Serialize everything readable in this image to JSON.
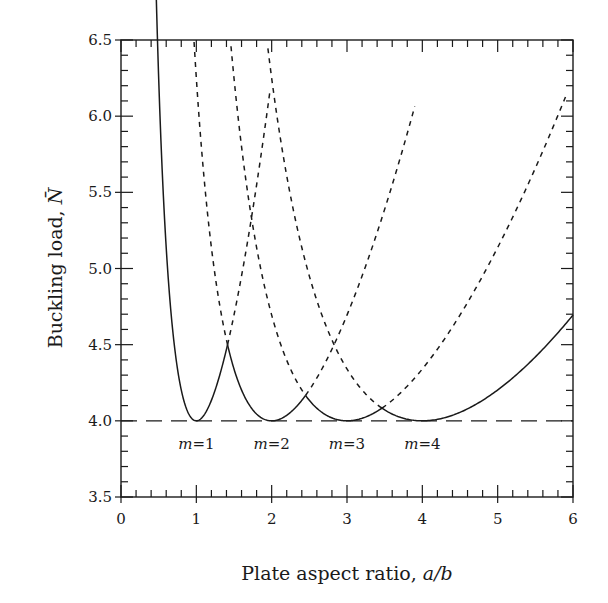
{
  "chart_data": {
    "type": "line",
    "title": "",
    "xlabel": "Plate aspect ratio, a/b",
    "xlabel_parts": {
      "text": "Plate aspect ratio, ",
      "italic": "a/b"
    },
    "ylabel": "Buckling load, N̄",
    "ylabel_parts": {
      "text": "Buckling load, ",
      "italic": "N̄"
    },
    "xlim": [
      0,
      6
    ],
    "ylim": [
      3.5,
      6.5
    ],
    "x_ticks": [
      "0",
      "1",
      "2",
      "3",
      "4",
      "5",
      "6"
    ],
    "y_ticks": [
      "3.5",
      "4.0",
      "4.5",
      "5.0",
      "5.5",
      "6.0",
      "6.5"
    ],
    "x_minor_step": 0.2,
    "y_minor_step": 0.1,
    "grid": false,
    "legend": null,
    "formula": "N = (m·b/a + a/(m·b))^2",
    "series": [
      {
        "name": "m=1",
        "m": 1,
        "label": "m=1",
        "label_x": 1.0,
        "solid_range": [
          0.45,
          1.414
        ],
        "dashed_range": [
          1.414,
          1.98
        ],
        "points": [
          [
            0.45,
            6.25
          ],
          [
            0.6,
            4.34
          ],
          [
            0.8,
            4.1
          ],
          [
            1.0,
            4.0
          ],
          [
            1.2,
            4.03
          ],
          [
            1.414,
            4.5
          ],
          [
            1.6,
            5.0
          ],
          [
            1.8,
            5.64
          ],
          [
            1.98,
            6.25
          ]
        ]
      },
      {
        "name": "m=2",
        "m": 2,
        "label": "m=2",
        "label_x": 2.0,
        "solid_range": [
          1.414,
          2.449
        ],
        "dashed_range": [
          [
            0.97,
            1.414
          ],
          [
            2.449,
            3.9
          ]
        ],
        "points": [
          [
            0.97,
            6.25
          ],
          [
            1.2,
            5.04
          ],
          [
            1.414,
            4.5
          ],
          [
            1.6,
            4.2
          ],
          [
            2.0,
            4.0
          ],
          [
            2.449,
            4.167
          ],
          [
            3.0,
            4.69
          ],
          [
            3.5,
            5.46
          ],
          [
            3.9,
            6.25
          ]
        ]
      },
      {
        "name": "m=3",
        "m": 3,
        "label": "m=3",
        "label_x": 3.0,
        "solid_range": [
          2.449,
          3.464
        ],
        "dashed_range": [
          [
            1.46,
            2.449
          ],
          [
            3.464,
            5.9
          ]
        ],
        "points": [
          [
            1.46,
            6.25
          ],
          [
            2.0,
            4.69
          ],
          [
            2.449,
            4.167
          ],
          [
            3.0,
            4.0
          ],
          [
            3.464,
            4.083
          ],
          [
            4.0,
            4.34
          ],
          [
            5.0,
            5.14
          ],
          [
            5.9,
            6.25
          ]
        ]
      },
      {
        "name": "m=4",
        "m": 4,
        "label": "m=4",
        "label_x": 4.0,
        "solid_range": [
          3.464,
          6.0
        ],
        "dashed_range": [
          [
            1.95,
            3.464
          ]
        ],
        "points": [
          [
            1.95,
            6.25
          ],
          [
            2.449,
            5.43
          ],
          [
            3.0,
            4.69
          ],
          [
            3.464,
            4.083
          ],
          [
            4.0,
            4.0
          ],
          [
            5.0,
            4.2
          ],
          [
            6.0,
            4.69
          ]
        ]
      }
    ],
    "reference_line": {
      "y": 4.0,
      "style": "long-dash",
      "x_range": [
        0,
        6
      ]
    },
    "colors": {
      "line": "#1a1a1a",
      "background": "#ffffff"
    }
  }
}
